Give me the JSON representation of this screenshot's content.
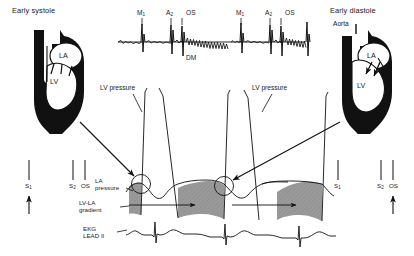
{
  "figure": {
    "type": "diagram",
    "background_color": "#ffffff",
    "ink_color": "#111111",
    "gradient_shading_color": "#9a9a9a"
  },
  "panels": {
    "left": {
      "title": "Early systole",
      "heart": {
        "chamber_labels": [
          "LA",
          "LV"
        ],
        "flow_note": "upward arrow in aorta, small arrows at mitral valve"
      },
      "sound_markers": [
        {
          "label": "S",
          "sub": "1",
          "arrow": "up"
        },
        {
          "label": "S",
          "sub": "2",
          "arrow": "none"
        },
        {
          "label": "OS",
          "sub": "",
          "arrow": "none"
        }
      ]
    },
    "right": {
      "title": "Early diastole",
      "heart": {
        "vessel_label": "Aorta",
        "chamber_labels": [
          "LA",
          "LV"
        ],
        "flow_note": "small arrows at mitral valve into LV"
      },
      "sound_markers": [
        {
          "label": "S",
          "sub": "1",
          "arrow": "none"
        },
        {
          "label": "S",
          "sub": "2",
          "arrow": "none"
        },
        {
          "label": "OS",
          "sub": "",
          "arrow": "up"
        }
      ]
    }
  },
  "phonocardiogram": {
    "beat_labels": [
      {
        "label": "M",
        "sub": "1"
      },
      {
        "label": "A",
        "sub": "2"
      },
      {
        "label": "OS",
        "sub": ""
      },
      {
        "label": "M",
        "sub": "1"
      },
      {
        "label": "A",
        "sub": "2"
      },
      {
        "label": "OS",
        "sub": ""
      }
    ],
    "murmur_label": "DM"
  },
  "tracings": {
    "lv_pressure_label_left": "LV pressure",
    "lv_pressure_label_right": "LV pressure",
    "la_pressure_label": "LA\npressure",
    "gradient_label": "LV-LA\ngradient",
    "ekg_label": "EKG\nLEAD II"
  }
}
